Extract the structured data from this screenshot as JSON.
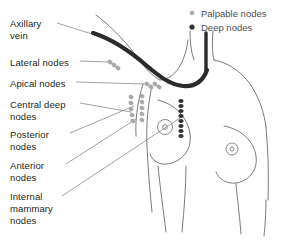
{
  "diagram": {
    "palette": {
      "outline": "#6b6b6b",
      "vein": "#2b2b2b",
      "palpable_node": "#a9a9a9",
      "deep_node": "#333333",
      "leader_line": "#8a8a8a",
      "label_text": "#231f20",
      "legend_text": "#4d4d4d",
      "background": "#ffffff"
    },
    "legend": {
      "items": [
        {
          "marker": "palpable-node-dot",
          "label": "Palpable nodes",
          "color": "#a9a9a9"
        },
        {
          "marker": "deep-node-dot",
          "label": "Deep nodes",
          "color": "#333333"
        }
      ]
    },
    "labels": [
      {
        "id": "axillary-vein",
        "lines": [
          "Axillary",
          "vein"
        ],
        "x": 10,
        "y": 18
      },
      {
        "id": "lateral-nodes",
        "lines": [
          "Lateral nodes"
        ],
        "x": 10,
        "y": 57
      },
      {
        "id": "apical-nodes",
        "lines": [
          "Apical nodes"
        ],
        "x": 10,
        "y": 78
      },
      {
        "id": "central-deep-nodes",
        "lines": [
          "Central deep",
          "nodes"
        ],
        "x": 10,
        "y": 99
      },
      {
        "id": "posterior-nodes",
        "lines": [
          "Posterior",
          "nodes"
        ],
        "x": 10,
        "y": 129
      },
      {
        "id": "anterior-nodes",
        "lines": [
          "Anterior",
          "nodes"
        ],
        "x": 10,
        "y": 160
      },
      {
        "id": "internal-mammary-nodes",
        "lines": [
          "Internal",
          "mammary",
          "nodes"
        ],
        "x": 10,
        "y": 191
      }
    ],
    "node_groups": [
      {
        "id": "lateral-nodes-cluster",
        "type": "palpable",
        "count": 3
      },
      {
        "id": "apical-nodes-cluster",
        "type": "palpable",
        "count": 4
      },
      {
        "id": "central-deep-nodes-cluster",
        "type": "palpable",
        "count": 5
      },
      {
        "id": "posterior-nodes-cluster",
        "type": "palpable",
        "count": 5
      },
      {
        "id": "internal-mammary-chain",
        "type": "deep",
        "count": 8
      }
    ]
  }
}
